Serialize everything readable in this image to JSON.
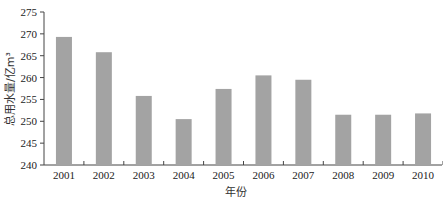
{
  "chart_data": {
    "type": "bar",
    "title": "",
    "xlabel": "年份",
    "ylabel": "总用水量/亿m³",
    "categories": [
      "2001",
      "2002",
      "2003",
      "2004",
      "2005",
      "2006",
      "2007",
      "2008",
      "2009",
      "2010"
    ],
    "values": [
      269.3,
      265.8,
      255.8,
      250.5,
      257.4,
      260.5,
      259.5,
      251.5,
      251.5,
      251.8
    ],
    "ylim": [
      240,
      275
    ],
    "yticks": [
      240,
      245,
      250,
      255,
      260,
      265,
      270,
      275
    ],
    "grid": false,
    "legend": null,
    "bar_color": "#a3a3a3"
  }
}
